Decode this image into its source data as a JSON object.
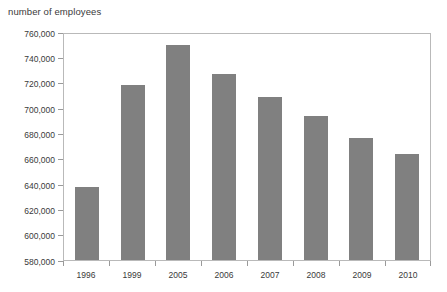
{
  "chart_data": {
    "type": "bar",
    "title": "number of employees",
    "xlabel": "",
    "ylabel": "",
    "categories": [
      "1996",
      "1999",
      "2005",
      "2006",
      "2007",
      "2008",
      "2009",
      "2010"
    ],
    "values": [
      638000,
      718000,
      750000,
      727000,
      709000,
      694000,
      676000,
      664000
    ],
    "ylim": [
      580000,
      760000
    ],
    "ytick_step": 20000,
    "ytick_labels": [
      "760,000",
      "740,000",
      "720,000",
      "700,000",
      "680,000",
      "660,000",
      "640,000",
      "620,000",
      "600,000",
      "580,000"
    ],
    "ytick_values": [
      760000,
      740000,
      720000,
      700000,
      680000,
      660000,
      640000,
      620000,
      600000,
      580000
    ],
    "grid": false,
    "legend": null,
    "bar_color": "#808080",
    "frame_color": "#b9b9b9",
    "axis_tick_color": "#9a9a9a",
    "text_color": "#3a3a3a",
    "background": "#ffffff"
  }
}
